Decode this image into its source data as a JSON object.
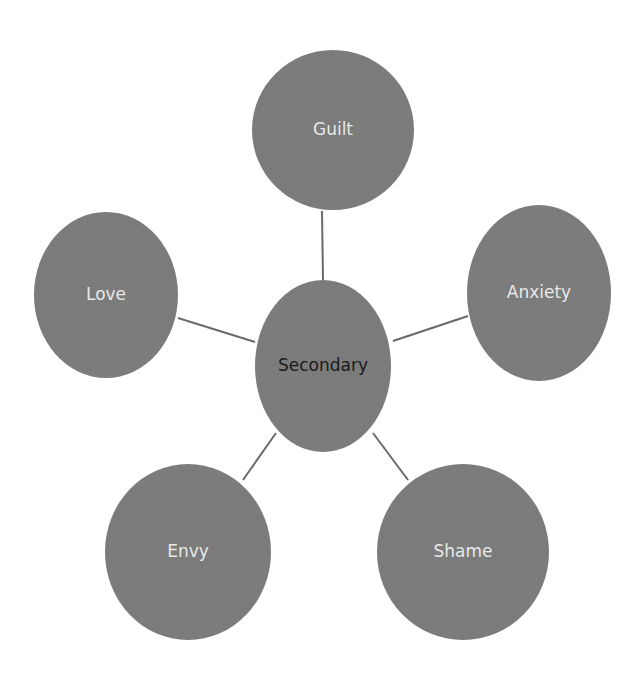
{
  "diagram": {
    "type": "hub-and-spoke",
    "canvas": {
      "width": 642,
      "height": 674,
      "background": "#ffffff"
    },
    "style": {
      "node_fill": "#7b7b7b",
      "connector_color": "#6a6a6a",
      "outer_label_color": "#e8e8e8",
      "center_label_color": "#1a1a1a"
    },
    "center": {
      "id": "secondary",
      "label": "Secondary",
      "cx": 323,
      "cy": 366,
      "rx": 68,
      "ry": 86
    },
    "nodes": [
      {
        "id": "guilt",
        "label": "Guilt",
        "cx": 333,
        "cy": 130,
        "rx": 81,
        "ry": 80
      },
      {
        "id": "anxiety",
        "label": "Anxiety",
        "cx": 539,
        "cy": 293,
        "rx": 72,
        "ry": 88
      },
      {
        "id": "shame",
        "label": "Shame",
        "cx": 463,
        "cy": 552,
        "rx": 86,
        "ry": 88
      },
      {
        "id": "envy",
        "label": "Envy",
        "cx": 188,
        "cy": 552,
        "rx": 83,
        "ry": 88
      },
      {
        "id": "love",
        "label": "Love",
        "cx": 106,
        "cy": 295,
        "rx": 72,
        "ry": 83
      }
    ],
    "connectors": [
      {
        "from": "secondary",
        "to": "guilt",
        "x1": 323,
        "y1": 280,
        "x2": 322,
        "y2": 211
      },
      {
        "from": "secondary",
        "to": "anxiety",
        "x1": 393,
        "y1": 341,
        "x2": 468,
        "y2": 316
      },
      {
        "from": "secondary",
        "to": "shame",
        "x1": 373,
        "y1": 433,
        "x2": 408,
        "y2": 480
      },
      {
        "from": "secondary",
        "to": "envy",
        "x1": 276,
        "y1": 433,
        "x2": 243,
        "y2": 480
      },
      {
        "from": "secondary",
        "to": "love",
        "x1": 255,
        "y1": 342,
        "x2": 178,
        "y2": 318
      }
    ]
  }
}
